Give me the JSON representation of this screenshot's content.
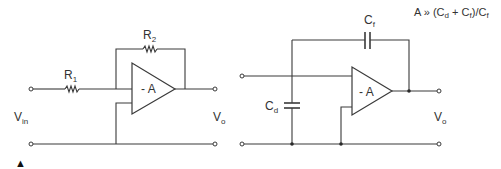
{
  "figure": {
    "marker": "▲",
    "left_circuit": {
      "name": "inverting amplifier",
      "components": [
        {
          "id": "R1",
          "label": "R",
          "subscript": "1",
          "type": "resistor"
        },
        {
          "id": "R2",
          "label": "R",
          "subscript": "2",
          "type": "resistor"
        }
      ],
      "opamp_label": "- A",
      "input_label": {
        "main": "V",
        "sub": "in"
      },
      "output_label": {
        "main": "V",
        "sub": "o"
      }
    },
    "right_circuit": {
      "name": "charge amplifier",
      "components": [
        {
          "id": "Cf",
          "label": "C",
          "subscript": "f",
          "type": "capacitor"
        },
        {
          "id": "Cd",
          "label": "C",
          "subscript": "d",
          "type": "capacitor"
        }
      ],
      "opamp_label": "- A",
      "output_label": {
        "main": "V",
        "sub": "o"
      },
      "condition": {
        "prefix": "A » (C",
        "sub1": "d",
        "mid": " + C",
        "sub2": "f",
        "mid2": ")/C",
        "sub3": "f"
      }
    }
  }
}
